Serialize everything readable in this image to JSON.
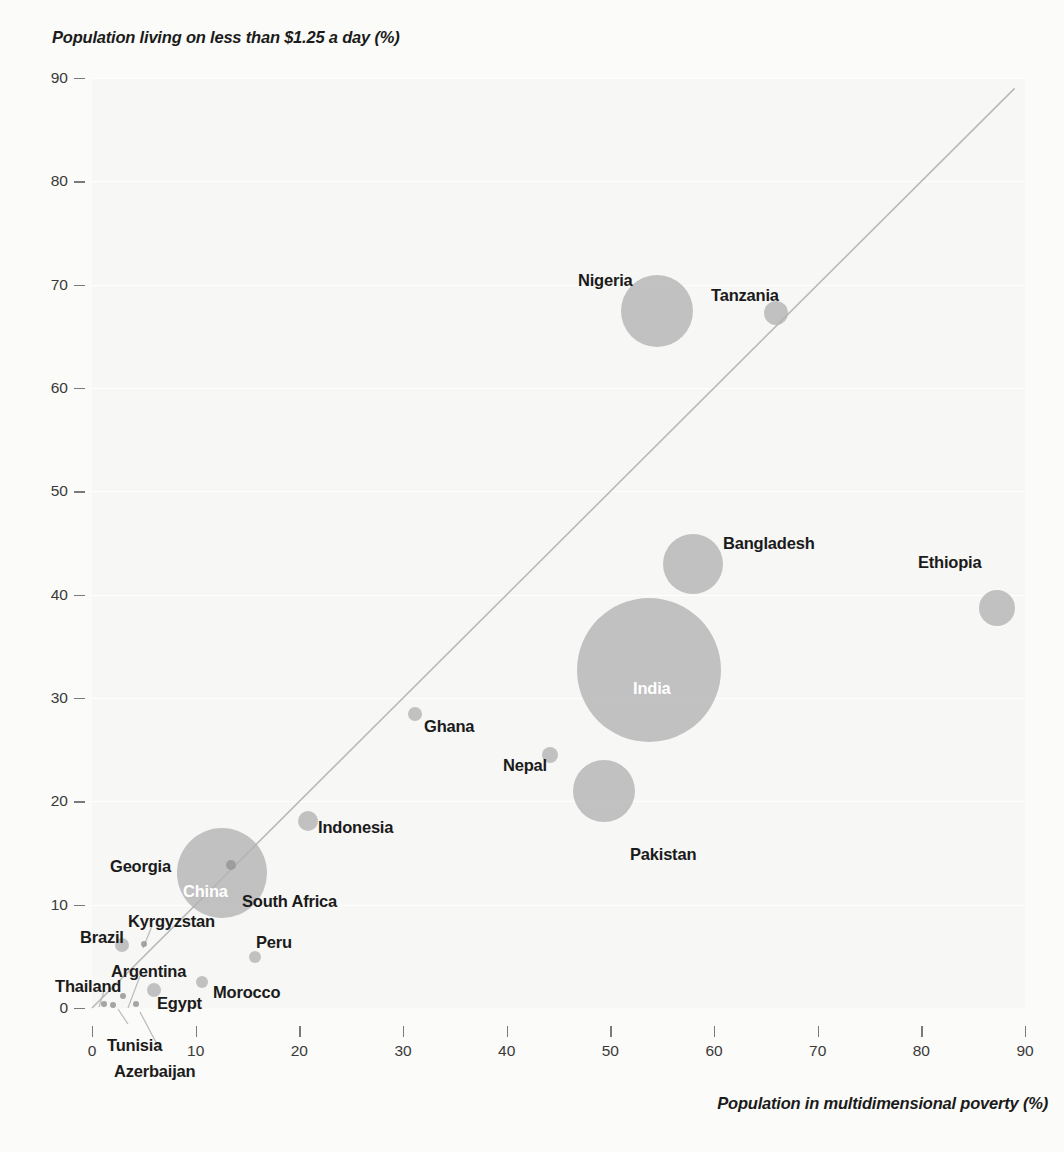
{
  "chart_data": {
    "type": "scatter",
    "title": "",
    "xlabel": "Population in multidimensional poverty (%)",
    "ylabel": "Population living on less than $1.25 a day (%)",
    "xlim": [
      0,
      90
    ],
    "ylim": [
      0,
      90
    ],
    "xticks": [
      "0",
      "10",
      "20",
      "30",
      "40",
      "50",
      "60",
      "70",
      "80",
      "90"
    ],
    "yticks": [
      "0",
      "10",
      "20",
      "30",
      "40",
      "50",
      "60",
      "70",
      "80",
      "90"
    ],
    "grid": true,
    "legend": "none",
    "annotations": [
      "Diagonal 45-degree reference line where multidimensional poverty equals income poverty"
    ],
    "size_encoding": "Bubble area proportional to population",
    "bubble_color": "#b2b2b2",
    "background_color": "#f7f7f5",
    "points": [
      {
        "name": "Nigeria",
        "x": 54.5,
        "y": 67.5,
        "r": 36,
        "label_pos": "left",
        "label_inside": false
      },
      {
        "name": "Tanzania",
        "x": 66.0,
        "y": 67.3,
        "r": 12,
        "label_pos": "left",
        "label_inside": false
      },
      {
        "name": "Bangladesh",
        "x": 58.0,
        "y": 43.0,
        "r": 30,
        "label_pos": "right",
        "label_inside": false
      },
      {
        "name": "Ethiopia",
        "x": 87.3,
        "y": 38.7,
        "r": 18,
        "label_pos": "left",
        "label_inside": false
      },
      {
        "name": "India",
        "x": 53.7,
        "y": 32.7,
        "r": 72,
        "label_pos": "center",
        "label_inside": true
      },
      {
        "name": "Ghana",
        "x": 31.2,
        "y": 28.5,
        "r": 7,
        "label_pos": "right",
        "label_inside": false
      },
      {
        "name": "Nepal",
        "x": 44.2,
        "y": 24.5,
        "r": 8,
        "label_pos": "left",
        "label_inside": false
      },
      {
        "name": "Pakistan",
        "x": 49.4,
        "y": 21.0,
        "r": 31,
        "label_pos": "below-right",
        "label_inside": false
      },
      {
        "name": "Indonesia",
        "x": 20.8,
        "y": 18.1,
        "r": 10,
        "label_pos": "right",
        "label_inside": false
      },
      {
        "name": "China",
        "x": 12.5,
        "y": 13.1,
        "r": 45,
        "label_pos": "center",
        "label_inside": true
      },
      {
        "name": "South Africa",
        "x": 13.4,
        "y": 13.8,
        "r": 5,
        "label_pos": "right",
        "label_inside": false
      },
      {
        "name": "Georgia",
        "x": 5.8,
        "y": 15.3,
        "r": 0,
        "label_pos": "left",
        "label_inside": false
      },
      {
        "name": "Brazil",
        "x": 2.9,
        "y": 6.1,
        "r": 7,
        "label_pos": "left",
        "label_inside": false
      },
      {
        "name": "Kyrgyzstan",
        "x": 5.0,
        "y": 6.2,
        "r": 3,
        "label_pos": "leader",
        "label_inside": false
      },
      {
        "name": "Peru",
        "x": 15.7,
        "y": 4.9,
        "r": 6,
        "label_pos": "above",
        "label_inside": false
      },
      {
        "name": "Morocco",
        "x": 10.6,
        "y": 2.5,
        "r": 6,
        "label_pos": "below-right",
        "label_inside": false
      },
      {
        "name": "Egypt",
        "x": 6.0,
        "y": 1.7,
        "r": 7,
        "label_pos": "below-right",
        "label_inside": false
      },
      {
        "name": "Argentina",
        "x": 3.0,
        "y": 1.2,
        "r": 3,
        "label_pos": "leader",
        "label_inside": false
      },
      {
        "name": "Thailand",
        "x": 1.2,
        "y": 0.4,
        "r": 3,
        "label_pos": "leader",
        "label_inside": false
      },
      {
        "name": "Tunisia",
        "x": 2.0,
        "y": 0.3,
        "r": 3,
        "label_pos": "leader",
        "label_inside": false
      },
      {
        "name": "Azerbaijan",
        "x": 4.2,
        "y": 0.4,
        "r": 3,
        "label_pos": "leader",
        "label_inside": false
      }
    ]
  },
  "axes": {
    "y_title": "Population living on less than $1.25 a day (%)",
    "x_title": "Population in multidimensional poverty (%)",
    "y_tick_labels": [
      "90",
      "80",
      "70",
      "60",
      "50",
      "40",
      "30",
      "20",
      "10",
      "0"
    ],
    "x_tick_labels": [
      "0",
      "10",
      "20",
      "30",
      "40",
      "50",
      "60",
      "70",
      "80",
      "90"
    ]
  },
  "labels": {
    "nigeria": "Nigeria",
    "tanzania": "Tanzania",
    "bangladesh": "Bangladesh",
    "ethiopia": "Ethiopia",
    "india": "India",
    "ghana": "Ghana",
    "nepal": "Nepal",
    "pakistan": "Pakistan",
    "indonesia": "Indonesia",
    "china": "China",
    "south_africa": "South Africa",
    "georgia": "Georgia",
    "brazil": "Brazil",
    "kyrgyzstan": "Kyrgyzstan",
    "peru": "Peru",
    "morocco": "Morocco",
    "egypt": "Egypt",
    "argentina": "Argentina",
    "thailand": "Thailand",
    "tunisia": "Tunisia",
    "azerbaijan": "Azerbaijan"
  }
}
